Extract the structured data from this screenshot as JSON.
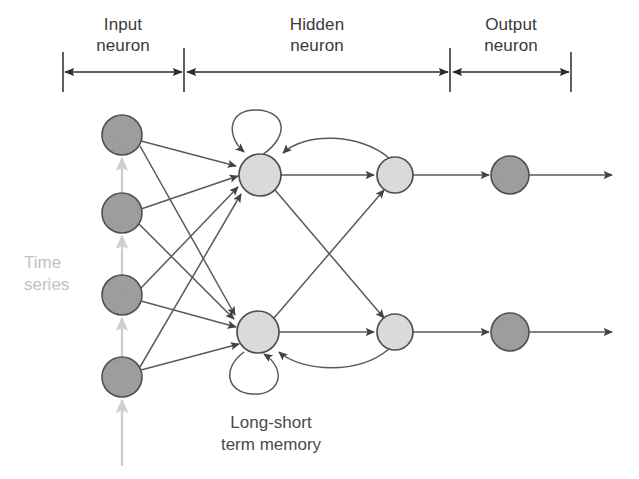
{
  "diagram": {
    "background_color": "#ffffff",
    "sections": [
      {
        "id": "input",
        "label": "Input\nneuron",
        "x_start": 63,
        "x_end": 183,
        "label_cx": 123,
        "label_top": 14
      },
      {
        "id": "hidden",
        "label": "Hidden\nneuron",
        "x_start": 186,
        "x_end": 449,
        "label_cx": 317,
        "label_top": 14
      },
      {
        "id": "output",
        "label": "Output\nneuron",
        "x_start": 452,
        "x_end": 571,
        "label_cx": 511,
        "label_top": 14
      }
    ],
    "ruler": {
      "axis_y": 72,
      "tick_top": 52,
      "tick_bottom": 92,
      "tick_positions": [
        63,
        184,
        450,
        571
      ],
      "line_color": "#2b2b2b",
      "line_width": 1.6
    },
    "labels": {
      "time_series": "Time\nseries",
      "time_series_x": 24,
      "time_series_y": 252,
      "time_series_color": "#c2c2c2",
      "memory_caption": "Long-short\nterm memory",
      "memory_caption_cx": 271,
      "memory_caption_top": 412
    },
    "colors": {
      "input_neuron_fill": "#9a9a9a",
      "hidden_neuron_fill": "#dcdcdc",
      "output_neuron_fill": "#9a9a9a",
      "neuron_stroke": "#3c3c3c",
      "edge_color": "#5a5a5a",
      "timeseries_arrow_color": "#cfcfcf",
      "text_color": "#3a3a3a"
    },
    "neurons": {
      "input": [
        {
          "id": "in-1",
          "cx": 122,
          "cy": 135,
          "r": 20
        },
        {
          "id": "in-2",
          "cx": 122,
          "cy": 213,
          "r": 20
        },
        {
          "id": "in-3",
          "cx": 122,
          "cy": 295,
          "r": 20
        },
        {
          "id": "in-4",
          "cx": 122,
          "cy": 377,
          "r": 20
        }
      ],
      "hidden_memory": [
        {
          "id": "lstm-1",
          "cx": 260,
          "cy": 175,
          "r": 21
        },
        {
          "id": "lstm-2",
          "cx": 258,
          "cy": 332,
          "r": 21
        }
      ],
      "hidden_context": [
        {
          "id": "ctx-1",
          "cx": 395,
          "cy": 175,
          "r": 18
        },
        {
          "id": "ctx-2",
          "cx": 395,
          "cy": 332,
          "r": 18
        }
      ],
      "output": [
        {
          "id": "out-1",
          "cx": 510,
          "cy": 175,
          "r": 19
        },
        {
          "id": "out-2",
          "cx": 510,
          "cy": 332,
          "r": 19
        }
      ]
    },
    "self_loops": [
      {
        "id": "loop-upper",
        "neuron": "lstm-1",
        "position": "above",
        "cx": 253,
        "cy": 142,
        "r": 26
      },
      {
        "id": "loop-lower",
        "neuron": "lstm-2",
        "position": "below",
        "cx": 251,
        "cy": 366,
        "r": 26
      }
    ],
    "edge_groups": [
      {
        "id": "input-to-hidden",
        "from": "input",
        "to": "hidden_memory",
        "count": 8,
        "style": "straight-arrow"
      },
      {
        "id": "hidden-crossbar",
        "from": "hidden_memory",
        "to": "hidden_context",
        "count": 4,
        "style": "straight-arrow"
      },
      {
        "id": "context-feedback",
        "from": "hidden_context",
        "to": "hidden_memory",
        "count": 2,
        "style": "curved-arrow"
      },
      {
        "id": "context-to-output",
        "from": "hidden_context",
        "to": "output",
        "count": 2,
        "style": "straight-arrow"
      },
      {
        "id": "output-terminal",
        "from": "output",
        "to": "exterior",
        "count": 2,
        "style": "straight-arrow"
      },
      {
        "id": "timeseries-feed",
        "from": "exterior",
        "to": "input",
        "count": 4,
        "style": "light-arrow"
      }
    ]
  }
}
